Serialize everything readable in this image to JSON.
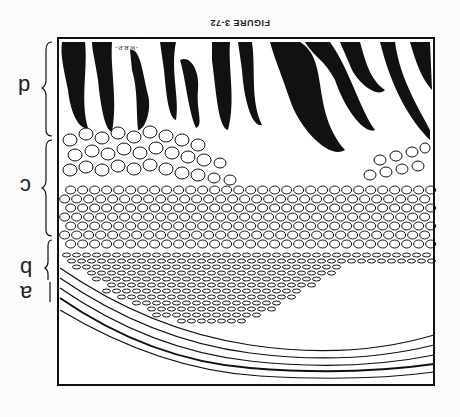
{
  "figure": {
    "caption": "FIGURE 3-72",
    "orientation": "upside-down (rotated 180°)",
    "artist_signature": "-W.R.P.-",
    "layer_labels": [
      {
        "id": "d",
        "label": "d",
        "region": "dark finger-like projections (top)"
      },
      {
        "id": "c",
        "label": "c",
        "region": "large round cells"
      },
      {
        "id": "b",
        "label": "b",
        "region": "smaller flattened cells"
      },
      {
        "id": "a",
        "label": "a",
        "region": "fibrous curved layer"
      }
    ]
  },
  "colors": {
    "ink": "#111111",
    "paper": "#fbfbfb"
  }
}
